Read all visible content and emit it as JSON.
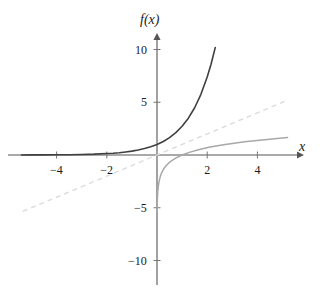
{
  "chart_data": {
    "type": "line",
    "title": "",
    "subtitle": "",
    "xlabel": "x",
    "ylabel": "f(x)",
    "xlim": [
      -5.6,
      5.6
    ],
    "ylim": [
      -11.5,
      11.0
    ],
    "grid": false,
    "legend": "none",
    "x_ticks": [
      -4,
      -2,
      2,
      4
    ],
    "x_tick_labels": [
      "−4",
      "−2",
      "2",
      "4"
    ],
    "y_ticks": [
      10,
      5,
      -5,
      -10
    ],
    "y_tick_labels": [
      "10",
      "5",
      "−5",
      "−10"
    ],
    "axis_arrows": [
      "x-positive",
      "y-positive"
    ],
    "annotations": [],
    "series": [
      {
        "name": "exponential",
        "expression": "e^x",
        "style": "solid",
        "color": "#404040",
        "width": 1.6,
        "x_range": [
          -5.4,
          2.32
        ],
        "points": [
          [
            -5.4,
            0.0
          ],
          [
            -5.0,
            0.01
          ],
          [
            -4.5,
            0.01
          ],
          [
            -4.0,
            0.02
          ],
          [
            -3.5,
            0.03
          ],
          [
            -3.0,
            0.05
          ],
          [
            -2.5,
            0.08
          ],
          [
            -2.0,
            0.14
          ],
          [
            -1.75,
            0.17
          ],
          [
            -1.5,
            0.22
          ],
          [
            -1.25,
            0.29
          ],
          [
            -1.0,
            0.37
          ],
          [
            -0.75,
            0.47
          ],
          [
            -0.5,
            0.61
          ],
          [
            -0.25,
            0.78
          ],
          [
            0.0,
            1.0
          ],
          [
            0.25,
            1.28
          ],
          [
            0.5,
            1.65
          ],
          [
            0.75,
            2.12
          ],
          [
            1.0,
            2.72
          ],
          [
            1.25,
            3.49
          ],
          [
            1.5,
            4.48
          ],
          [
            1.75,
            5.75
          ],
          [
            2.0,
            7.39
          ],
          [
            2.15,
            8.58
          ],
          [
            2.32,
            10.18
          ]
        ]
      },
      {
        "name": "logarithm",
        "expression": "ln x",
        "style": "solid",
        "color": "#a8a8a8",
        "width": 1.5,
        "x_range": [
          0.0045,
          5.2
        ],
        "points": [
          [
            0.0045,
            -5.4
          ],
          [
            0.0067,
            -5.0
          ],
          [
            0.0111,
            -4.5
          ],
          [
            0.0183,
            -4.0
          ],
          [
            0.0302,
            -3.5
          ],
          [
            0.0498,
            -3.0
          ],
          [
            0.0821,
            -2.5
          ],
          [
            0.1353,
            -2.0
          ],
          [
            0.1738,
            -1.75
          ],
          [
            0.2231,
            -1.5
          ],
          [
            0.2865,
            -1.25
          ],
          [
            0.3679,
            -1.0
          ],
          [
            0.4724,
            -0.75
          ],
          [
            0.6065,
            -0.5
          ],
          [
            0.7788,
            -0.25
          ],
          [
            1.0,
            0.0
          ],
          [
            1.284,
            0.25
          ],
          [
            1.6487,
            0.5
          ],
          [
            2.117,
            0.75
          ],
          [
            2.7183,
            1.0
          ],
          [
            3.4903,
            1.25
          ],
          [
            4.4817,
            1.5
          ],
          [
            5.2,
            1.65
          ]
        ]
      },
      {
        "name": "identity-line",
        "expression": "y = x",
        "style": "dashed",
        "color": "#dcdcdc",
        "width": 1.4,
        "x_range": [
          -5.35,
          5.2
        ],
        "points": [
          [
            -5.35,
            -5.35
          ],
          [
            5.2,
            5.2
          ]
        ]
      }
    ]
  },
  "axes": {
    "x_axis_label": "x",
    "y_axis_label": "f(x)",
    "x_axis_color": "#555555",
    "y_axis_color": "#555555"
  },
  "ticks": {
    "x": [
      {
        "value": -4,
        "label": "−4"
      },
      {
        "value": -2,
        "label": "−2"
      },
      {
        "value": 2,
        "label": "2"
      },
      {
        "value": 4,
        "label": "4"
      }
    ],
    "y": [
      {
        "value": 10,
        "label": "10"
      },
      {
        "value": 5,
        "label": "5"
      },
      {
        "value": -5,
        "label": "−5"
      },
      {
        "value": -10,
        "label": "−10"
      }
    ]
  }
}
